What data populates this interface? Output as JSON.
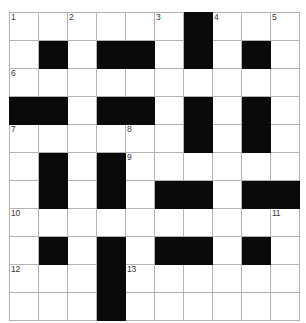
{
  "puzzle": {
    "title": "Crossword Grid",
    "rows": 11,
    "cols": 10,
    "cell_size_px": 28,
    "colors": {
      "block": "#0a0a0a",
      "cell": "#ffffff",
      "gridline": "#b4b4b4",
      "number": "#3a3a3a"
    },
    "numbers": [
      {
        "number": "1",
        "row": 0,
        "col": 0
      },
      {
        "number": "2",
        "row": 0,
        "col": 2
      },
      {
        "number": "3",
        "row": 0,
        "col": 5
      },
      {
        "number": "4",
        "row": 0,
        "col": 7
      },
      {
        "number": "5",
        "row": 0,
        "col": 9
      },
      {
        "number": "6",
        "row": 2,
        "col": 0
      },
      {
        "number": "7",
        "row": 4,
        "col": 0
      },
      {
        "number": "8",
        "row": 4,
        "col": 4
      },
      {
        "number": "9",
        "row": 5,
        "col": 4
      },
      {
        "number": "10",
        "row": 7,
        "col": 0
      },
      {
        "number": "11",
        "row": 7,
        "col": 9
      },
      {
        "number": "12",
        "row": 9,
        "col": 0
      },
      {
        "number": "13",
        "row": 9,
        "col": 4
      }
    ],
    "grid": [
      [
        0,
        0,
        0,
        0,
        0,
        0,
        1,
        0,
        0,
        0
      ],
      [
        0,
        1,
        0,
        1,
        1,
        0,
        1,
        0,
        1,
        0
      ],
      [
        0,
        0,
        0,
        0,
        0,
        0,
        0,
        0,
        0,
        0
      ],
      [
        1,
        1,
        0,
        1,
        1,
        0,
        1,
        0,
        1,
        0
      ],
      [
        0,
        0,
        0,
        0,
        0,
        0,
        1,
        0,
        1,
        0
      ],
      [
        0,
        1,
        0,
        1,
        0,
        0,
        0,
        0,
        0,
        0
      ],
      [
        0,
        1,
        0,
        1,
        0,
        1,
        1,
        0,
        1,
        1
      ],
      [
        0,
        0,
        0,
        0,
        0,
        0,
        0,
        0,
        0,
        0
      ],
      [
        0,
        1,
        0,
        1,
        0,
        1,
        1,
        0,
        1,
        0
      ],
      [
        0,
        0,
        0,
        1,
        0,
        0,
        0,
        0,
        0,
        0
      ],
      [
        0,
        0,
        0,
        1,
        0,
        0,
        0,
        0,
        0,
        0
      ]
    ]
  }
}
